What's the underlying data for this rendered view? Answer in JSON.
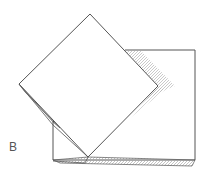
{
  "figure": {
    "panel_label": "B",
    "colors": {
      "line": "#555555",
      "shade": "#bdbdbd",
      "paper": "#ffffff"
    }
  }
}
